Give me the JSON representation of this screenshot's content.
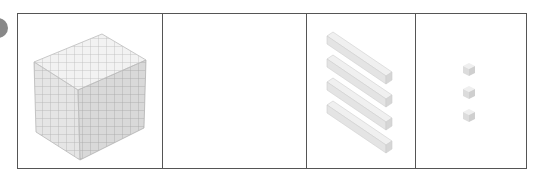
{
  "diagram": {
    "type": "base-ten-blocks",
    "cells": [
      {
        "name": "thousands",
        "block": "cube",
        "count": 1,
        "width": 146
      },
      {
        "name": "hundreds",
        "block": "flat",
        "count": 0,
        "width": 144
      },
      {
        "name": "tens",
        "block": "rod",
        "count": 4,
        "width": 110
      },
      {
        "name": "ones",
        "block": "unit",
        "count": 3,
        "width": 110
      }
    ],
    "colors": {
      "border": "#555555",
      "block_face": "#eeeeee",
      "block_line": "#b5b5b5",
      "block_shadow": "#d6d6d6"
    }
  }
}
